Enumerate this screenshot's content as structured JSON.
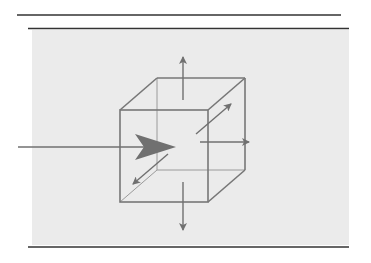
{
  "diagram": {
    "colors": {
      "background": "#ffffff",
      "channel_fill": "#ebebeb",
      "border_lines": "#333333",
      "cube_edges": "#777777",
      "arrows": "#707070"
    },
    "elements": {
      "top_outer_line": {
        "x1": 17,
        "y1": 15,
        "x2": 341,
        "y2": 15
      },
      "top_channel_line": {
        "x1": 28,
        "y1": 28,
        "x2": 349,
        "y2": 28
      },
      "bottom_channel_line": {
        "x1": 28,
        "y1": 247,
        "x2": 349,
        "y2": 247
      },
      "channel_rect": {
        "x": 32,
        "y": 30,
        "w": 317,
        "h": 215
      },
      "cube": {
        "front_face": {
          "x": 120,
          "y": 110,
          "w": 88,
          "h": 92
        },
        "back_face": {
          "x": 157,
          "y": 78,
          "w": 88,
          "h": 92
        }
      },
      "arrows": [
        {
          "name": "inflow",
          "x1": 18,
          "y1": 147,
          "x2": 175,
          "y2": 147,
          "large_head": true
        },
        {
          "name": "up",
          "x1": 183,
          "y1": 100,
          "x2": 183,
          "y2": 56
        },
        {
          "name": "down",
          "x1": 183,
          "y1": 182,
          "x2": 183,
          "y2": 230
        },
        {
          "name": "right",
          "x1": 200,
          "y1": 142,
          "x2": 249,
          "y2": 142
        },
        {
          "name": "back-diagonal",
          "x1": 196,
          "y1": 134,
          "x2": 231,
          "y2": 104
        },
        {
          "name": "front-diagonal",
          "x1": 168,
          "y1": 154,
          "x2": 133,
          "y2": 184
        }
      ]
    }
  }
}
